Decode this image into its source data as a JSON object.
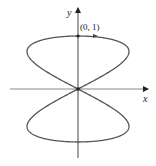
{
  "diagram": {
    "type": "parametric-curve",
    "axes": {
      "x_label": "x",
      "y_label": "y"
    },
    "points": [
      {
        "label": "(0, 1)",
        "x": 0,
        "y": 1
      }
    ],
    "curve": {
      "description": "figure-eight curve through origin, symmetric about both axes",
      "direction_arrow": "at (0,1) pointing right",
      "color": "#555555"
    }
  }
}
